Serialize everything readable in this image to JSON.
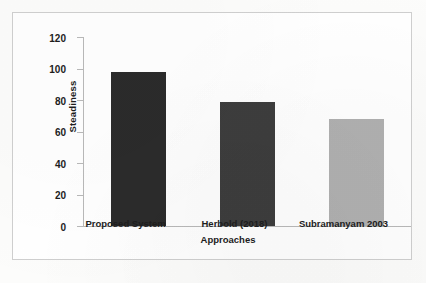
{
  "chart_data": {
    "type": "bar",
    "title": "",
    "xlabel": "Approaches",
    "ylabel": "Steadiness",
    "categories": [
      "Proposed System",
      "Herbold (2018)",
      "Subramanyam 2003"
    ],
    "values": [
      98,
      79,
      68
    ],
    "ylim": [
      0,
      120
    ],
    "yticks": [
      0,
      20,
      40,
      60,
      80,
      100,
      120
    ],
    "ytick_labels": [
      "0",
      "20",
      "40",
      "60",
      "80",
      "100",
      "120"
    ],
    "grid": false,
    "legend": null,
    "bar_colors": [
      "#2b2b2b",
      "#3d3d3d",
      "#b0b0b0"
    ],
    "series": [
      {
        "name": "Steadiness",
        "values": [
          98,
          79,
          68
        ]
      }
    ]
  },
  "figure": {
    "frame_color": "#cfcfcf",
    "axis_color": "#b9b9b9",
    "background": "#ffffff",
    "page_background": "#fcfcfb",
    "text_color": "#1d1d1d"
  }
}
